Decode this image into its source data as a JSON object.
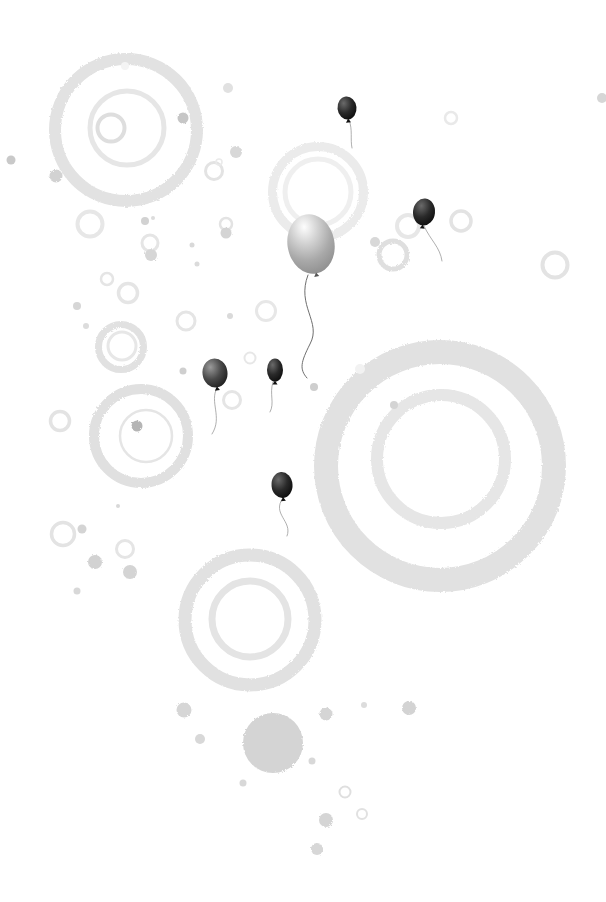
{
  "scene": {
    "width": 606,
    "height": 902,
    "background": "#ffffff"
  },
  "palette": {
    "string_light": "#9a9a9a",
    "string_dark": "#6e6e6e",
    "knot_dark": "#111111",
    "knot_gray": "#555555",
    "balloon_gray_stops": [
      "#fdfdfd",
      "#d2d2d2",
      "#a9a9a9",
      "#8c8c8c"
    ],
    "balloon_dark_stops": [
      "#6a6a6a",
      "#2a2a2a",
      "#070707"
    ],
    "balloon_mid_stops": [
      "#9a9a9a",
      "#4a4a4a",
      "#161616"
    ]
  },
  "rings": [
    {
      "cx": 126,
      "cy": 130,
      "r": 71,
      "w": 12,
      "color": "#e2e2e2",
      "textured": true
    },
    {
      "cx": 127,
      "cy": 128,
      "r": 37,
      "w": 5,
      "color": "#e6e6e6",
      "textured": false
    },
    {
      "cx": 111,
      "cy": 128,
      "r": 13.5,
      "w": 4,
      "color": "#dedede",
      "textured": false
    },
    {
      "cx": 214,
      "cy": 171,
      "r": 8.5,
      "w": 3,
      "color": "#e3e3e3",
      "textured": false
    },
    {
      "cx": 219,
      "cy": 162,
      "r": 3,
      "w": 1.5,
      "color": "#eaeaea",
      "textured": false
    },
    {
      "cx": 90,
      "cy": 224,
      "r": 12.5,
      "w": 4,
      "color": "#e7e7e7",
      "textured": false
    },
    {
      "cx": 150,
      "cy": 243,
      "r": 8,
      "w": 3,
      "color": "#e5e5e5",
      "textured": false
    },
    {
      "cx": 226,
      "cy": 224,
      "r": 6,
      "w": 2.5,
      "color": "#e3e3e3",
      "textured": false
    },
    {
      "cx": 107,
      "cy": 279,
      "r": 6,
      "w": 2.5,
      "color": "#e5e5e5",
      "textured": false
    },
    {
      "cx": 128,
      "cy": 293,
      "r": 9.5,
      "w": 3.5,
      "color": "#e5e5e5",
      "textured": false
    },
    {
      "cx": 318,
      "cy": 192,
      "r": 45.5,
      "w": 9,
      "color": "#ebebeb",
      "textured": true
    },
    {
      "cx": 318,
      "cy": 192,
      "r": 33,
      "w": 5,
      "color": "#efefef",
      "textured": false
    },
    {
      "cx": 451,
      "cy": 118,
      "r": 6,
      "w": 2.5,
      "color": "#e9e9e9",
      "textured": false
    },
    {
      "cx": 408,
      "cy": 226,
      "r": 11,
      "w": 4,
      "color": "#e7e7e7",
      "textured": false
    },
    {
      "cx": 461,
      "cy": 221,
      "r": 10,
      "w": 3.5,
      "color": "#e3e3e3",
      "textured": false
    },
    {
      "cx": 393,
      "cy": 255,
      "r": 14,
      "w": 5,
      "color": "#dfdfdf",
      "textured": true
    },
    {
      "cx": 555,
      "cy": 265,
      "r": 12.5,
      "w": 4,
      "color": "#e3e3e3",
      "textured": false
    },
    {
      "cx": 250,
      "cy": 358,
      "r": 5.5,
      "w": 2,
      "color": "#e7e7e7",
      "textured": false
    },
    {
      "cx": 232,
      "cy": 400,
      "r": 8.5,
      "w": 3,
      "color": "#e5e5e5",
      "textured": false
    },
    {
      "cx": 121,
      "cy": 347,
      "r": 22.5,
      "w": 7,
      "color": "#e1e1e1",
      "textured": true
    },
    {
      "cx": 122,
      "cy": 346,
      "r": 14,
      "w": 3,
      "color": "#e7e7e7",
      "textured": false
    },
    {
      "cx": 186,
      "cy": 321,
      "r": 9,
      "w": 3,
      "color": "#e5e5e5",
      "textured": false
    },
    {
      "cx": 266,
      "cy": 311,
      "r": 9.5,
      "w": 3,
      "color": "#e7e7e7",
      "textured": false
    },
    {
      "cx": 141,
      "cy": 436,
      "r": 47,
      "w": 10,
      "color": "#e0e0e0",
      "textured": true
    },
    {
      "cx": 146,
      "cy": 436,
      "r": 26,
      "w": 2.5,
      "color": "#e5e5e5",
      "textured": false
    },
    {
      "cx": 60,
      "cy": 421,
      "r": 9.5,
      "w": 3.5,
      "color": "#e3e3e3",
      "textured": false
    },
    {
      "cx": 63,
      "cy": 534,
      "r": 11.5,
      "w": 3.5,
      "color": "#e3e3e3",
      "textured": false
    },
    {
      "cx": 125,
      "cy": 549,
      "r": 8.5,
      "w": 3,
      "color": "#e5e5e5",
      "textured": false
    },
    {
      "cx": 440,
      "cy": 466,
      "r": 114,
      "w": 24,
      "color": "#e1e1e1",
      "textured": true
    },
    {
      "cx": 441,
      "cy": 459,
      "r": 64,
      "w": 12,
      "color": "#e6e6e6",
      "textured": true
    },
    {
      "cx": 250,
      "cy": 620,
      "r": 65,
      "w": 13,
      "color": "#e1e1e1",
      "textured": true
    },
    {
      "cx": 250,
      "cy": 619,
      "r": 38,
      "w": 7,
      "color": "#e4e4e4",
      "textured": false
    },
    {
      "cx": 345,
      "cy": 792,
      "r": 5.5,
      "w": 2,
      "color": "#dfdfdf",
      "textured": false
    },
    {
      "cx": 362,
      "cy": 814,
      "r": 5,
      "w": 2,
      "color": "#e1e1e1",
      "textured": false
    }
  ],
  "dots": [
    {
      "cx": 183,
      "cy": 118,
      "r": 5.5,
      "color": "#c6c6c6"
    },
    {
      "cx": 228,
      "cy": 88,
      "r": 5,
      "color": "#e1e1e1"
    },
    {
      "cx": 11,
      "cy": 160,
      "r": 4.5,
      "color": "#c9c9c9"
    },
    {
      "cx": 56,
      "cy": 176,
      "r": 6.5,
      "color": "#d2d2d2"
    },
    {
      "cx": 236,
      "cy": 152,
      "r": 6,
      "color": "#d8d8d8"
    },
    {
      "cx": 145,
      "cy": 221,
      "r": 4,
      "color": "#d2d2d2"
    },
    {
      "cx": 153,
      "cy": 218,
      "r": 2,
      "color": "#dcdcdc"
    },
    {
      "cx": 151,
      "cy": 255,
      "r": 6,
      "color": "#d6d6d6"
    },
    {
      "cx": 192,
      "cy": 245,
      "r": 2.5,
      "color": "#d9d9d9"
    },
    {
      "cx": 197,
      "cy": 264,
      "r": 2.5,
      "color": "#dbdbdb"
    },
    {
      "cx": 226,
      "cy": 233,
      "r": 5.5,
      "color": "#d4d4d4"
    },
    {
      "cx": 375,
      "cy": 242,
      "r": 5,
      "color": "#d8d8d8"
    },
    {
      "cx": 602,
      "cy": 98,
      "r": 5,
      "color": "#d6d6d6"
    },
    {
      "cx": 77,
      "cy": 306,
      "r": 4,
      "color": "#d6d6d6"
    },
    {
      "cx": 86,
      "cy": 326,
      "r": 3,
      "color": "#dcdcdc"
    },
    {
      "cx": 230,
      "cy": 316,
      "r": 3,
      "color": "#dadada"
    },
    {
      "cx": 183,
      "cy": 371,
      "r": 3.5,
      "color": "#cfcfcf"
    },
    {
      "cx": 137,
      "cy": 426,
      "r": 5.5,
      "color": "#b5b5b5"
    },
    {
      "cx": 118,
      "cy": 506,
      "r": 2,
      "color": "#d8d8d8"
    },
    {
      "cx": 82,
      "cy": 529,
      "r": 4.5,
      "color": "#d4d4d4"
    },
    {
      "cx": 95,
      "cy": 562,
      "r": 7,
      "color": "#d2d2d2"
    },
    {
      "cx": 130,
      "cy": 572,
      "r": 7,
      "color": "#d4d4d4"
    },
    {
      "cx": 77,
      "cy": 591,
      "r": 3.5,
      "color": "#d8d8d8"
    },
    {
      "cx": 314,
      "cy": 387,
      "r": 4,
      "color": "#cecece"
    },
    {
      "cx": 394,
      "cy": 405,
      "r": 4,
      "color": "#d4d4d4"
    },
    {
      "cx": 360,
      "cy": 369,
      "r": 5,
      "color": "#f2f2f2"
    },
    {
      "cx": 125,
      "cy": 66,
      "r": 4,
      "color": "#f4f4f4"
    },
    {
      "cx": 184,
      "cy": 710,
      "r": 7.5,
      "color": "#d6d6d6"
    },
    {
      "cx": 200,
      "cy": 739,
      "r": 5,
      "color": "#d8d8d8"
    },
    {
      "cx": 273,
      "cy": 743,
      "r": 30,
      "color": "#d4d4d4"
    },
    {
      "cx": 243,
      "cy": 783,
      "r": 3.5,
      "color": "#d8d8d8"
    },
    {
      "cx": 326,
      "cy": 714,
      "r": 6.5,
      "color": "#d5d5d5"
    },
    {
      "cx": 364,
      "cy": 705,
      "r": 3,
      "color": "#dcdcdc"
    },
    {
      "cx": 409,
      "cy": 708,
      "r": 7,
      "color": "#d3d3d3"
    },
    {
      "cx": 312,
      "cy": 761,
      "r": 3.5,
      "color": "#d8d8d8"
    },
    {
      "cx": 326,
      "cy": 820,
      "r": 7,
      "color": "#d5d5d5"
    },
    {
      "cx": 317,
      "cy": 849,
      "r": 6,
      "color": "#d7d7d7"
    }
  ],
  "balloons": [
    {
      "id": "balloon-large-gray",
      "cx": 311,
      "cy": 244,
      "rx": 23.5,
      "ry": 30,
      "tilt": -10,
      "fill": "gray",
      "string": "M308,275 C296,306 322,322 310,344 C301,362 299,369 307,378",
      "string_color": "#6e6e6e",
      "string_w": 1
    },
    {
      "id": "balloon-top-black",
      "cx": 347,
      "cy": 108,
      "rx": 9.5,
      "ry": 11.5,
      "tilt": -6,
      "fill": "dark",
      "string": "M349,120 C353,130 350,139 352,148",
      "string_color": "#9a9a9a",
      "string_w": 0.8
    },
    {
      "id": "balloon-right-black",
      "cx": 424,
      "cy": 212,
      "rx": 11,
      "ry": 13.5,
      "tilt": 6,
      "fill": "dark",
      "string": "M424,226 C431,241 440,247 442,261",
      "string_color": "#9a9a9a",
      "string_w": 0.8
    },
    {
      "id": "balloon-left-gray",
      "cx": 215,
      "cy": 373,
      "rx": 12.5,
      "ry": 14.5,
      "tilt": -8,
      "fill": "mid",
      "string": "M217,388 C209,402 223,417 212,434",
      "string_color": "#9a9a9a",
      "string_w": 0.8
    },
    {
      "id": "balloon-mid-black",
      "cx": 275,
      "cy": 370,
      "rx": 8,
      "ry": 11.5,
      "tilt": 0,
      "fill": "dark",
      "string": "M273,382 C269,394 275,403 270,412",
      "string_color": "#9a9a9a",
      "string_w": 0.8
    },
    {
      "id": "balloon-lower-black",
      "cx": 282,
      "cy": 485,
      "rx": 10.5,
      "ry": 13,
      "tilt": -5,
      "fill": "dark",
      "string": "M283,498 C271,514 293,521 287,536",
      "string_color": "#9a9a9a",
      "string_w": 0.8
    }
  ]
}
